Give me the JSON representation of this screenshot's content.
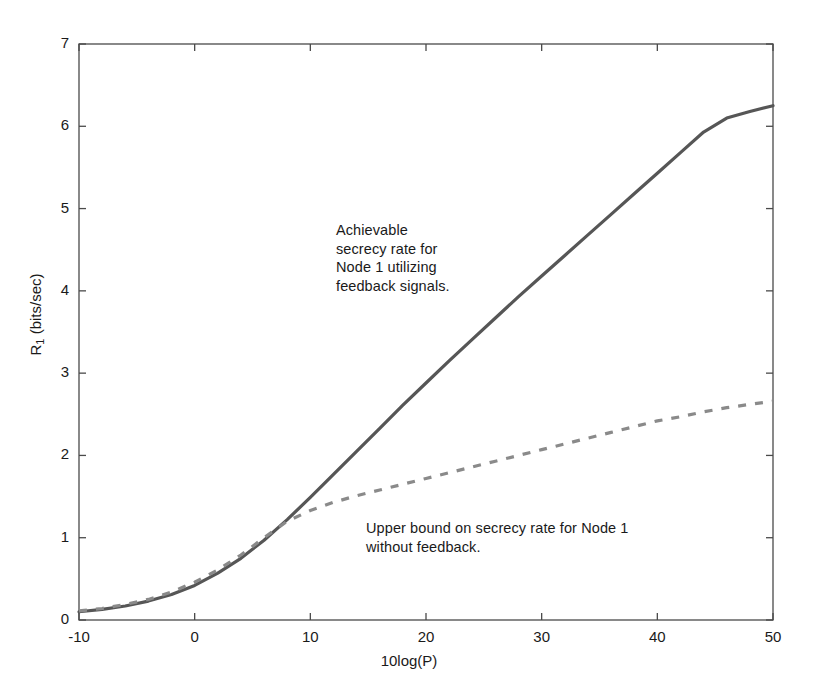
{
  "chart_data": {
    "type": "line",
    "title": "",
    "xlabel": "10log(P)",
    "ylabel_main": "R",
    "ylabel_sub": "1",
    "ylabel_rest": " (bits/sec)",
    "ylabel": "R_1 (bits/sec)",
    "xlim": [
      -10,
      50
    ],
    "ylim": [
      0,
      7
    ],
    "xticks": [
      -10,
      0,
      10,
      20,
      30,
      40,
      50
    ],
    "xticklabels": [
      "-10",
      "0",
      "10",
      "20",
      "30",
      "40",
      "50"
    ],
    "yticks": [
      0,
      1,
      2,
      3,
      4,
      5,
      6,
      7
    ],
    "yticklabels": [
      "0",
      "1",
      "2",
      "3",
      "4",
      "5",
      "6",
      "7"
    ],
    "grid": false,
    "legend": "none",
    "box": true,
    "tick_direction": "in",
    "series": [
      {
        "name": "Achievable secrecy rate for Node 1 utilizing feedback signals.",
        "style": "solid",
        "color": "#565656",
        "width": 3.2,
        "x": [
          -10,
          -8,
          -6,
          -4,
          -2,
          0,
          2,
          4,
          6,
          8,
          10,
          12,
          14,
          16,
          18,
          20,
          22,
          24,
          26,
          28,
          30,
          32,
          34,
          36,
          38,
          40,
          42,
          44,
          46,
          48,
          50
        ],
        "y": [
          0.1,
          0.13,
          0.17,
          0.23,
          0.31,
          0.42,
          0.57,
          0.75,
          0.97,
          1.22,
          1.49,
          1.77,
          2.05,
          2.33,
          2.61,
          2.88,
          3.15,
          3.41,
          3.67,
          3.93,
          4.18,
          4.43,
          4.68,
          4.93,
          5.18,
          5.43,
          5.68,
          5.93,
          6.1,
          6.18,
          6.25
        ]
      },
      {
        "name": "Upper bound on secrecy rate for Node 1 without feedback.",
        "style": "dashed",
        "color": "#8a8a8a",
        "width": 3.2,
        "dash": [
          8,
          9
        ],
        "x": [
          -10,
          -8,
          -6,
          -4,
          -2,
          0,
          2,
          4,
          6,
          8,
          10,
          12,
          14,
          16,
          18,
          20,
          22,
          24,
          26,
          28,
          30,
          32,
          34,
          36,
          38,
          40,
          42,
          44,
          46,
          48,
          50
        ],
        "y": [
          0.11,
          0.14,
          0.19,
          0.25,
          0.34,
          0.46,
          0.61,
          0.79,
          1.0,
          1.2,
          1.33,
          1.43,
          1.51,
          1.58,
          1.65,
          1.72,
          1.79,
          1.86,
          1.93,
          2.0,
          2.07,
          2.14,
          2.21,
          2.28,
          2.35,
          2.42,
          2.47,
          2.53,
          2.58,
          2.62,
          2.66
        ]
      }
    ],
    "annotations": [
      {
        "id": "achievable",
        "lines": [
          "Achievable",
          "secrecy rate for",
          "Node 1 utilizing",
          "feedback signals."
        ],
        "text": "Achievable\nsecrecy rate for\nNode 1 utilizing\nfeedback signals.",
        "x_data": 12.2,
        "y_data": 4.2
      },
      {
        "id": "upper",
        "lines": [
          "Upper bound on secrecy rate for Node 1",
          "without feedback."
        ],
        "text": "Upper bound on secrecy rate for Node 1\nwithout feedback.",
        "x_data": 14.8,
        "y_data": 1.03
      }
    ]
  },
  "axis_colors": {
    "frame": "#4a4a4a",
    "text": "#1a1a1a",
    "background": "#ffffff"
  }
}
